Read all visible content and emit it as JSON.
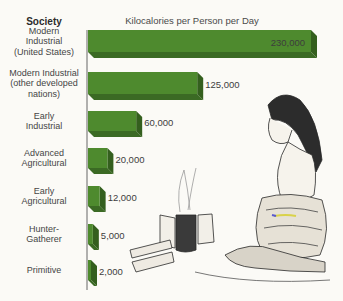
{
  "chart_data": {
    "type": "bar",
    "orientation": "horizontal",
    "style": "3d",
    "title": "Kilocalories per Person per Day",
    "category_header": "Society",
    "xlabel": "Kilocalories per Person per Day",
    "ylabel": "Society",
    "categories": [
      [
        "Modern",
        "Industrial",
        "(United States)"
      ],
      [
        "Modern Industrial",
        "(other developed",
        "nations)"
      ],
      [
        "Early",
        "Industrial"
      ],
      [
        "Advanced",
        "Agricultural"
      ],
      [
        "Early",
        "Agricultural"
      ],
      [
        "Hunter-",
        "Gatherer"
      ],
      [
        "Primitive"
      ]
    ],
    "values": [
      230000,
      125000,
      60000,
      20000,
      12000,
      5000,
      2000
    ],
    "value_labels": [
      "230,000",
      "125,000",
      "60,000",
      "20,000",
      "12,000",
      "5,000",
      "2,000"
    ],
    "xlim": [
      0,
      230000
    ],
    "grid": false,
    "legend": "none",
    "colors": {
      "bar_front": "#4e8a2e",
      "bar_side": "#345f1e",
      "bar_bottom": "#3b6a24",
      "axis": "#555555"
    },
    "annotations": [
      "Illustration: woman kneeling beside a campfire"
    ]
  }
}
